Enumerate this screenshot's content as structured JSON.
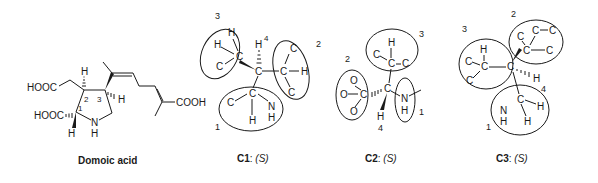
{
  "domoic_acid": {
    "caption": "Domoic acid",
    "labels": {
      "cooh_top": "HOOC",
      "cooh_bottom": "HOOC",
      "cooh_right": "COOH",
      "n": "N",
      "nh_h": "H",
      "h_c1": "H",
      "h_c2": "H",
      "h_c3": "H",
      "pos1": "1",
      "pos2": "2",
      "pos3": "3"
    }
  },
  "centers": [
    {
      "id": "C1",
      "caption_bold": "C1",
      "caption_config": "(S)",
      "priorities": [
        "1",
        "2",
        "3",
        "4"
      ],
      "atoms": {
        "center": "C",
        "g3": [
          "H",
          "H",
          "C",
          "C"
        ],
        "g2": [
          "C",
          "C",
          "H",
          "C"
        ],
        "g1": [
          "C",
          "C",
          "N",
          "H",
          "H"
        ],
        "h4": "H"
      }
    },
    {
      "id": "C2",
      "caption_bold": "C2",
      "caption_config": "(S)",
      "priorities": [
        "1",
        "2",
        "3",
        "4"
      ],
      "atoms": {
        "center": "C",
        "g3": [
          "H",
          "C",
          "C",
          "C"
        ],
        "g2": [
          "O",
          "O",
          "O",
          "C"
        ],
        "g1": [
          "N",
          "H"
        ],
        "h4": "H"
      }
    },
    {
      "id": "C3",
      "caption_bold": "C3",
      "caption_config": "(S)",
      "priorities": [
        "1",
        "2",
        "3",
        "4"
      ],
      "atoms": {
        "center": "C",
        "g3": [
          "H",
          "C",
          "C",
          "C"
        ],
        "g2": [
          "C",
          "C",
          "C",
          "C",
          "C"
        ],
        "g1": [
          "C",
          "N",
          "H",
          "H",
          "H"
        ],
        "h4": "H"
      }
    }
  ]
}
